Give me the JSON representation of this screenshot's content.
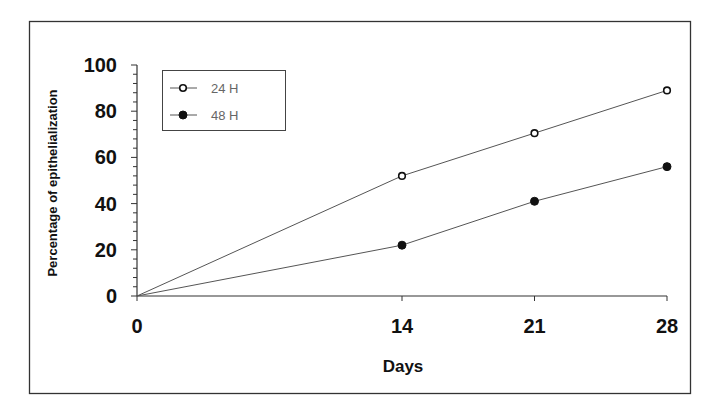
{
  "chart_data": {
    "type": "line",
    "title": "",
    "xlabel": "Days",
    "ylabel": "Percentage of epithelialization",
    "x": [
      0,
      14,
      21,
      28
    ],
    "x_ticks": [
      "0",
      "14",
      "21",
      "28"
    ],
    "y_ticks": [
      "0",
      "20",
      "40",
      "60",
      "80",
      "100"
    ],
    "ylim": [
      0,
      100
    ],
    "xlim": [
      0,
      28
    ],
    "grid": false,
    "legend_position": "upper-left",
    "series": [
      {
        "name": "24 H",
        "marker": "open-circle",
        "values": [
          0,
          52,
          70.5,
          89
        ]
      },
      {
        "name": "48 H",
        "marker": "filled-circle",
        "values": [
          0,
          22,
          41,
          56
        ]
      }
    ]
  },
  "colors": {
    "line": "#555555",
    "marker": "#111111",
    "frame": "#333333",
    "background": "#ffffff"
  }
}
